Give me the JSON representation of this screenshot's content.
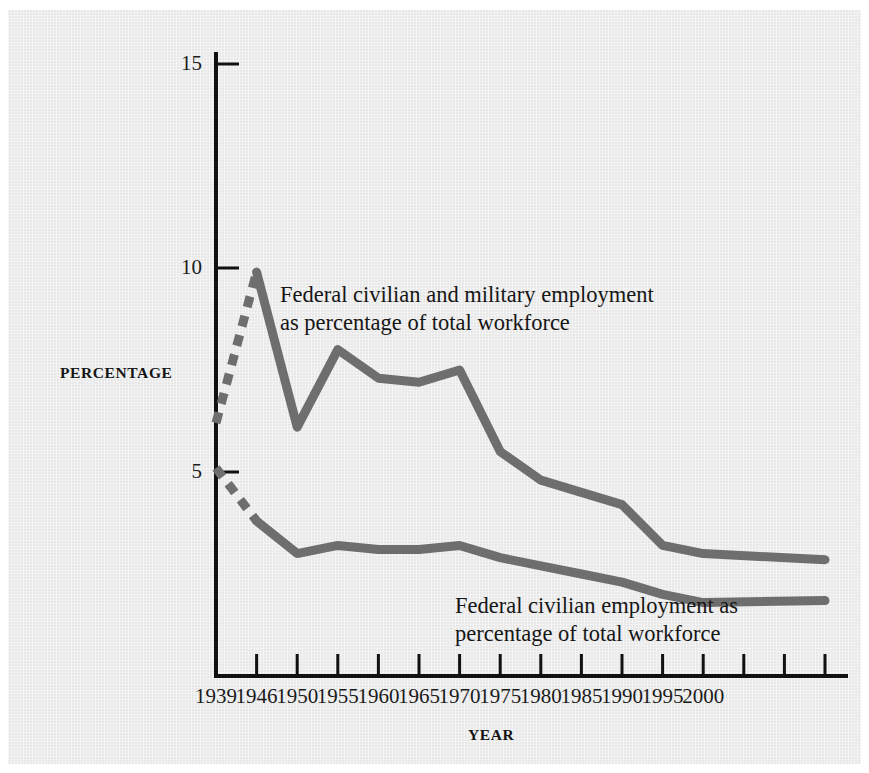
{
  "figure": {
    "background_color": "#eeeeee",
    "paper_color": "#ffffff",
    "line_color": "#6e6e6e",
    "axis_color": "#111111",
    "text_color": "#1b1b1b"
  },
  "axes": {
    "y_axis_title": "PERCENTAGE",
    "x_axis_title": "YEAR",
    "y_ticks": [
      {
        "value": 15,
        "label": "15"
      },
      {
        "value": 10,
        "label": "10"
      },
      {
        "value": 5,
        "label": "5"
      }
    ],
    "x_ticks": [
      {
        "value": 1939,
        "label": "1939"
      },
      {
        "value": 1946,
        "label": "1946"
      },
      {
        "value": 1950,
        "label": "1950"
      },
      {
        "value": 1955,
        "label": "1955"
      },
      {
        "value": 1960,
        "label": "1960"
      },
      {
        "value": 1965,
        "label": "1965"
      },
      {
        "value": 1970,
        "label": "1970"
      },
      {
        "value": 1975,
        "label": "1975"
      },
      {
        "value": 1980,
        "label": "1980"
      },
      {
        "value": 1985,
        "label": "1985"
      },
      {
        "value": 1990,
        "label": "1990"
      },
      {
        "value": 1995,
        "label": "1995"
      },
      {
        "value": 2000,
        "label": "2000"
      },
      {
        "value": 2001,
        "label": ""
      },
      {
        "value": 2002,
        "label": ""
      },
      {
        "value": 2003,
        "label": ""
      }
    ]
  },
  "annotations": {
    "upper": {
      "line1": "Federal civilian and military employment",
      "line2": "as percentage of total workforce"
    },
    "lower": {
      "line1": "Federal civilian employment as",
      "line2": "percentage of total workforce"
    }
  },
  "chart_data": {
    "type": "line",
    "title": "",
    "subtitle": "",
    "xlabel": "YEAR",
    "ylabel": "PERCENTAGE",
    "xlim": [
      1939,
      2003
    ],
    "ylim": [
      0,
      15.6
    ],
    "grid": false,
    "legend_position": "inline-annotation",
    "categories": [
      1939,
      1946,
      1950,
      1955,
      1960,
      1965,
      1970,
      1975,
      1980,
      1985,
      1990,
      1995,
      2000,
      2003
    ],
    "series": [
      {
        "name": "Federal civilian and military employment as percentage of total workforce",
        "color": "#6e6e6e",
        "dashed_from": 1939,
        "dashed_to": 1946,
        "values": [
          6.2,
          9.9,
          6.1,
          8.0,
          7.3,
          7.2,
          7.5,
          5.5,
          4.8,
          4.5,
          4.2,
          3.2,
          3.0,
          2.85
        ]
      },
      {
        "name": "Federal civilian employment as percentage of total workforce",
        "color": "#6e6e6e",
        "dashed_from": 1939,
        "dashed_to": 1946,
        "values": [
          5.1,
          3.8,
          3.0,
          3.2,
          3.1,
          3.1,
          3.2,
          2.9,
          2.7,
          2.5,
          2.3,
          2.0,
          1.8,
          1.85
        ]
      }
    ]
  }
}
